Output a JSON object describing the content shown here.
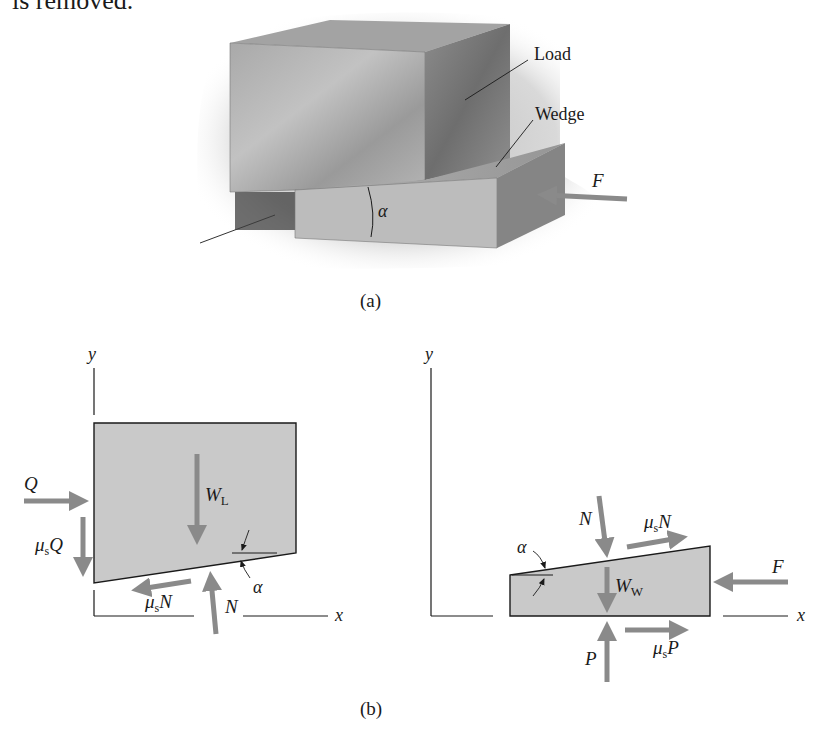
{
  "header_text": "is removed.",
  "part_a": {
    "caption": "(a)",
    "labels": {
      "load": "Load",
      "wedge": "Wedge",
      "force": "F",
      "angle": "α"
    }
  },
  "part_b": {
    "caption": "(b)",
    "load_fbd": {
      "axis_y": "y",
      "axis_x": "x",
      "forces": {
        "q": "Q",
        "mu_q_mu": "μ",
        "mu_q_sub": "s",
        "mu_q_var": "Q",
        "weight": "W",
        "weight_sub": "L",
        "normal": "N",
        "mu_n_mu": "μ",
        "mu_n_sub": "s",
        "mu_n_var": "N",
        "angle": "α"
      }
    },
    "wedge_fbd": {
      "axis_y": "y",
      "axis_x": "x",
      "forces": {
        "normal": "N",
        "mu_n_mu": "μ",
        "mu_n_sub": "s",
        "mu_n_var": "N",
        "weight": "W",
        "weight_sub": "W",
        "f": "F",
        "p": "P",
        "mu_p_mu": "μ",
        "mu_p_sub": "s",
        "mu_p_var": "P",
        "angle": "α"
      }
    }
  },
  "colors": {
    "arrow": "#8a8a8a",
    "fill": "#c9c9c9",
    "outline": "#1a1a1a",
    "block_light": "#b8b8b8",
    "block_dark": "#7c7c7c",
    "shadow": "#d6d6d6"
  }
}
